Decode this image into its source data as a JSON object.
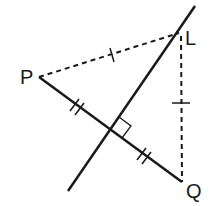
{
  "diagram": {
    "points": {
      "P": {
        "label": "P",
        "x": 39,
        "y": 77
      },
      "L": {
        "label": "L",
        "x": 179,
        "y": 33
      },
      "Q": {
        "label": "Q",
        "x": 182,
        "y": 182
      }
    },
    "labels": {
      "P": "P",
      "L": "L",
      "Q": "Q"
    },
    "segments": [
      {
        "name": "PQ",
        "style": "solid",
        "tick_marks": 2,
        "note": "bisected at foot of perpendicular"
      },
      {
        "name": "PL",
        "style": "dashed",
        "tick_marks": 1
      },
      {
        "name": "LQ",
        "style": "dashed",
        "tick_marks": 1
      },
      {
        "name": "perpendicular-bisector",
        "style": "solid",
        "through": "L"
      }
    ],
    "right_angle_marker": true,
    "colors": {
      "line": "#1a1a1a",
      "background": "#ffffff"
    }
  }
}
